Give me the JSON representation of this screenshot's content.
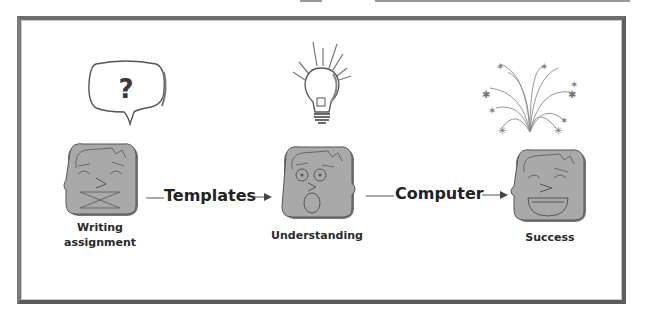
{
  "diagram": {
    "stages": [
      {
        "id": "writing-assignment",
        "label_line1": "Writing",
        "label_line2": "assignment",
        "face": "puzzled-face",
        "thought": "question-mark-bubble",
        "thought_text": "?"
      },
      {
        "id": "understanding",
        "label": "Understanding",
        "face": "surprised-face",
        "thought": "lightbulb"
      },
      {
        "id": "success",
        "label": "Success",
        "face": "happy-face",
        "thought": "fireworks"
      }
    ],
    "arrows": [
      {
        "label": "Templates",
        "from": "writing-assignment",
        "to": "understanding"
      },
      {
        "label": "Computer",
        "from": "understanding",
        "to": "success"
      }
    ],
    "colors": {
      "face_fill": "#a9a9a9",
      "face_outline": "#555555",
      "frame": "#6e6e6e",
      "text": "#222222"
    }
  }
}
